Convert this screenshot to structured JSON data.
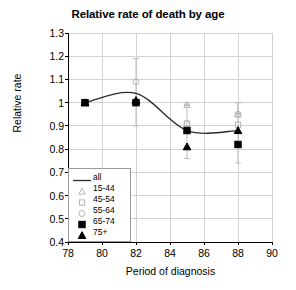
{
  "chart_data": {
    "type": "scatter",
    "title": "Relative rate of death by age",
    "xlabel": "Period of diagnosis",
    "ylabel": "Relative rate",
    "xlim": [
      78,
      90
    ],
    "ylim": [
      0.4,
      1.3
    ],
    "xticks": [
      78,
      80,
      82,
      84,
      86,
      88,
      90
    ],
    "xtick_labels": [
      "78",
      "80",
      "82",
      "84",
      "86",
      "88",
      "90"
    ],
    "yticks": [
      0.4,
      0.5,
      0.6,
      0.7,
      0.8,
      0.9,
      1.0,
      1.1,
      1.2,
      1.3
    ],
    "ytick_labels": [
      "0.4",
      "0.5",
      "0.6",
      "0.7",
      "0.8",
      "0.9",
      "1",
      "1.1",
      "1.2",
      "1.3"
    ],
    "grid": true,
    "legend_position": "lower-left-inside",
    "x": [
      79,
      82,
      85,
      88
    ],
    "series": [
      {
        "name": "all",
        "marker": "line",
        "style": "solid-line",
        "values": [
          1.0,
          1.04,
          0.88,
          0.88
        ]
      },
      {
        "name": "15-44",
        "marker": "triangle-open",
        "values": [
          1.0,
          1.0,
          0.99,
          0.95
        ],
        "err_low": [
          null,
          null,
          0.99,
          0.95
        ],
        "err_high": [
          null,
          null,
          1.0,
          1.0
        ]
      },
      {
        "name": "45-54",
        "marker": "square-open",
        "values": [
          1.0,
          1.0,
          0.91,
          0.905
        ]
      },
      {
        "name": "55-64",
        "marker": "diamond-open",
        "values": [
          1.0,
          1.09,
          0.91,
          0.95
        ],
        "err_low": [
          null,
          0.9,
          null,
          null
        ],
        "err_high": [
          null,
          1.19,
          null,
          null
        ]
      },
      {
        "name": "65-74",
        "marker": "square-filled",
        "values": [
          1.0,
          1.0,
          0.88,
          0.82
        ]
      },
      {
        "name": "75+",
        "marker": "triangle-filled",
        "values": [
          1.0,
          1.01,
          0.81,
          0.88
        ],
        "err_low": [
          null,
          null,
          0.76,
          0.74
        ],
        "err_high": [
          null,
          null,
          0.99,
          1.0
        ]
      }
    ]
  },
  "legend": {
    "entries": [
      {
        "label": "all",
        "marker": "line"
      },
      {
        "label": "15-44",
        "marker": "triangle-open"
      },
      {
        "label": "45-54",
        "marker": "square-open"
      },
      {
        "label": "55-64",
        "marker": "diamond-open"
      },
      {
        "label": "65-74",
        "marker": "square-filled"
      },
      {
        "label": "75+",
        "marker": "triangle-filled"
      }
    ]
  },
  "colors": {
    "axis": "#000000",
    "grid": "#d2d2d2",
    "line": "#2b2b2b",
    "marker_open": "#b4b4b4",
    "marker_filled": "#000000",
    "errorbar": "#bdbdbd",
    "legend_border": "#9a9a9a"
  }
}
